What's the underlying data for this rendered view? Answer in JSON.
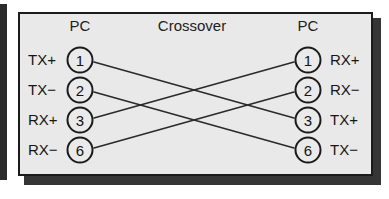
{
  "diagram": {
    "title": "Crossover",
    "left_device_label": "PC",
    "right_device_label": "PC",
    "colors": {
      "panel_fill": "#e9e9e9",
      "border": "#1b1b1b",
      "wire": "#2a2a2a",
      "shadow": "#353535",
      "text": "#161616",
      "background": "#ffffff"
    },
    "left_pins": [
      {
        "signal": "TX+",
        "number": "1"
      },
      {
        "signal": "TX−",
        "number": "2"
      },
      {
        "signal": "RX+",
        "number": "3"
      },
      {
        "signal": "RX−",
        "number": "6"
      }
    ],
    "right_pins": [
      {
        "signal": "RX+",
        "number": "1"
      },
      {
        "signal": "RX−",
        "number": "2"
      },
      {
        "signal": "TX+",
        "number": "3"
      },
      {
        "signal": "TX−",
        "number": "6"
      }
    ],
    "connections": [
      {
        "from_pin": "1",
        "to_pin": "3",
        "from_signal": "TX+",
        "to_signal": "TX+"
      },
      {
        "from_pin": "2",
        "to_pin": "6",
        "from_signal": "TX−",
        "to_signal": "TX−"
      },
      {
        "from_pin": "3",
        "to_pin": "1",
        "from_signal": "RX+",
        "to_signal": "RX+"
      },
      {
        "from_pin": "6",
        "to_pin": "2",
        "from_signal": "RX−",
        "to_signal": "RX−"
      }
    ]
  }
}
